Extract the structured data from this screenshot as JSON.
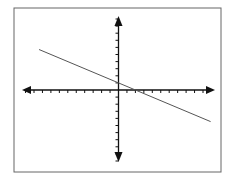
{
  "chart_data": {
    "type": "line",
    "title": "",
    "xlabel": "",
    "ylabel": "",
    "xlim": [
      -11,
      11
    ],
    "ylim": [
      -10,
      10
    ],
    "grid": false,
    "legend": null,
    "axes": {
      "x_tick_count_left": 11,
      "x_tick_count_right": 10,
      "y_tick_count_up": 10,
      "y_tick_count_down": 10,
      "arrows": true
    },
    "series": [
      {
        "name": "line",
        "equation": "y = -0.5x + 1",
        "slope": -0.5,
        "intercept": 1,
        "x": [
          -9.4,
          10.9
        ],
        "y": [
          5.7,
          -4.45
        ]
      }
    ]
  },
  "style": {
    "line_color": "#555555",
    "axis_color": "#111111",
    "border_color": "#666666"
  }
}
